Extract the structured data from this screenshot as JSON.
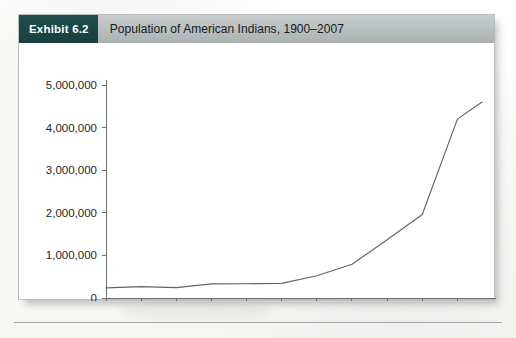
{
  "exhibit": {
    "badge_label": "Exhibit 6.2",
    "title": "Population of American Indians, 1900–2007"
  },
  "colors": {
    "badge_background": "#1f4f4c",
    "header_background": "#b9c0c0",
    "line_color": "#5d6668",
    "axis_color": "#6e7374",
    "card_background": "#ffffff",
    "page_background": "#fdfdfb"
  },
  "chart_data": {
    "type": "line",
    "title": "Population of American Indians, 1900–2007",
    "xlabel": "",
    "ylabel": "",
    "x": [
      1900,
      1910,
      1920,
      1930,
      1940,
      1950,
      1960,
      1970,
      1980,
      1990,
      2000,
      2007
    ],
    "values": [
      237000,
      266000,
      244000,
      332000,
      334000,
      343000,
      523000,
      792000,
      1366000,
      1959000,
      4199000,
      4600000
    ],
    "series": [
      {
        "name": "Population of American Indians",
        "values": [
          237000,
          266000,
          244000,
          332000,
          334000,
          343000,
          523000,
          792000,
          1366000,
          1959000,
          4199000,
          4600000
        ]
      }
    ],
    "xlim": [
      1900,
      2007
    ],
    "ylim": [
      0,
      5000000
    ],
    "xticks": [
      1900,
      1910,
      1920,
      1930,
      1940,
      1950,
      1960,
      1970,
      1980,
      1990,
      2000
    ],
    "xtick_labels": [
      "1900",
      "1910",
      "1920",
      "1930",
      "1940",
      "1950",
      "1960",
      "1970",
      "1980",
      "1990",
      "2000"
    ],
    "yticks": [
      0,
      1000000,
      2000000,
      3000000,
      4000000,
      5000000
    ],
    "ytick_labels": [
      "0",
      "1,000,000",
      "2,000,000",
      "3,000,000",
      "4,000,000",
      "5,000,000"
    ],
    "grid": false,
    "legend": false,
    "legend_position": "none"
  }
}
